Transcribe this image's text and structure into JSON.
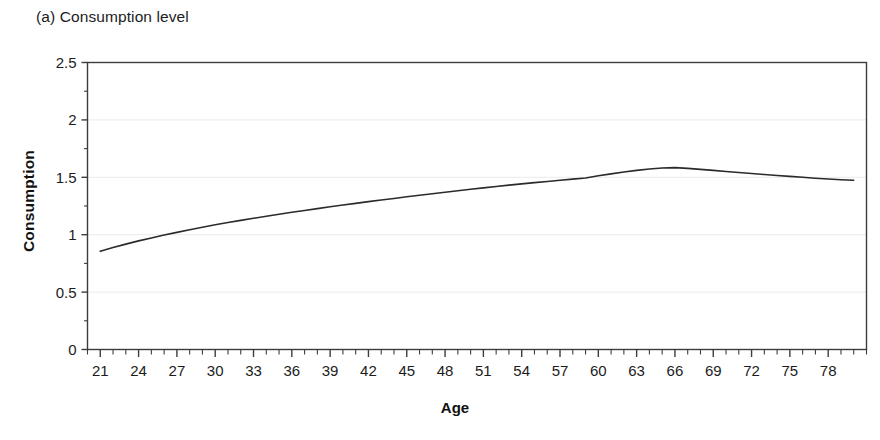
{
  "figure": {
    "panel_caption": "(a) Consumption level",
    "background_color": "#ffffff",
    "line_color": "#2b2b2b",
    "axis_color": "#3d3d3d",
    "grid_color": "#eaeaea"
  },
  "chart_data": {
    "type": "line",
    "title": "(a) Consumption level",
    "xlabel": "Age",
    "ylabel": "Consumption",
    "xlim": [
      20,
      81
    ],
    "ylim": [
      0,
      2.5
    ],
    "grid": true,
    "legend": null,
    "y_ticks": [
      0,
      0.5,
      1,
      1.5,
      2,
      2.5
    ],
    "y_tick_labels": [
      "0",
      "0.5",
      "1",
      "1.5",
      "2",
      "2.5"
    ],
    "x_ticks": [
      21,
      24,
      27,
      30,
      33,
      36,
      39,
      42,
      45,
      48,
      51,
      54,
      57,
      60,
      63,
      66,
      69,
      72,
      75,
      78
    ],
    "x_tick_labels": [
      "21",
      "24",
      "27",
      "30",
      "33",
      "36",
      "39",
      "42",
      "45",
      "48",
      "51",
      "54",
      "57",
      "60",
      "63",
      "66",
      "69",
      "72",
      "75",
      "78"
    ],
    "x_minor_tick_step": 1,
    "series": [
      {
        "name": "Consumption",
        "x": [
          21,
          22,
          23,
          24,
          25,
          26,
          27,
          28,
          29,
          30,
          31,
          32,
          33,
          34,
          35,
          36,
          37,
          38,
          39,
          40,
          41,
          42,
          43,
          44,
          45,
          46,
          47,
          48,
          49,
          50,
          51,
          52,
          53,
          54,
          55,
          56,
          57,
          58,
          59,
          60,
          61,
          62,
          63,
          64,
          65,
          66,
          67,
          68,
          69,
          70,
          71,
          72,
          73,
          74,
          75,
          76,
          77,
          78,
          79,
          80
        ],
        "y": [
          0.855,
          0.888,
          0.918,
          0.946,
          0.972,
          0.997,
          1.02,
          1.043,
          1.065,
          1.086,
          1.106,
          1.125,
          1.143,
          1.161,
          1.178,
          1.195,
          1.211,
          1.227,
          1.243,
          1.258,
          1.273,
          1.288,
          1.302,
          1.316,
          1.33,
          1.344,
          1.357,
          1.37,
          1.383,
          1.396,
          1.408,
          1.42,
          1.432,
          1.443,
          1.454,
          1.464,
          1.474,
          1.484,
          1.494,
          1.513,
          1.53,
          1.546,
          1.56,
          1.572,
          1.581,
          1.584,
          1.578,
          1.569,
          1.56,
          1.551,
          1.542,
          1.533,
          1.524,
          1.516,
          1.508,
          1.5,
          1.492,
          1.485,
          1.479,
          1.474
        ]
      }
    ],
    "annotations": []
  }
}
